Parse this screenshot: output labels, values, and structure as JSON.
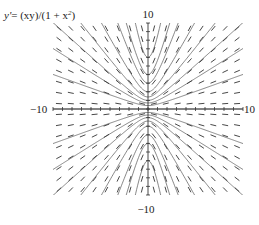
{
  "chart_data": {
    "type": "direction_field",
    "equation_display": {
      "lhs": "y'",
      "rhs": "= (xy)/(1  +  x",
      "sup": "2",
      "close": ")"
    },
    "xlabel": "",
    "ylabel": "",
    "xlim": [
      -10,
      10
    ],
    "ylim": [
      -10,
      10
    ],
    "tick_labels": {
      "x_min": "−10",
      "x_max": "10",
      "y_min": "−10",
      "y_max": "10"
    },
    "tick_step": 1,
    "grid": false,
    "slope_field": {
      "x_step": 1.25,
      "y_step": 1.25,
      "segment_length_px": 6
    },
    "solution_curves": {
      "family": "y = C * sqrt(1 + x^2)",
      "C_values": [
        -10,
        -6,
        -4,
        -3,
        -2,
        -1.4,
        -1,
        -0.7,
        -0.4,
        0,
        0.4,
        0.7,
        1,
        1.4,
        2,
        3,
        4,
        6,
        10
      ]
    }
  },
  "layout": {
    "plot_px": {
      "left": 53,
      "right": 243,
      "top": 23,
      "bottom": 195
    },
    "colors": {
      "axis": "#333333",
      "curve": "#555555",
      "field": "#333333"
    }
  }
}
